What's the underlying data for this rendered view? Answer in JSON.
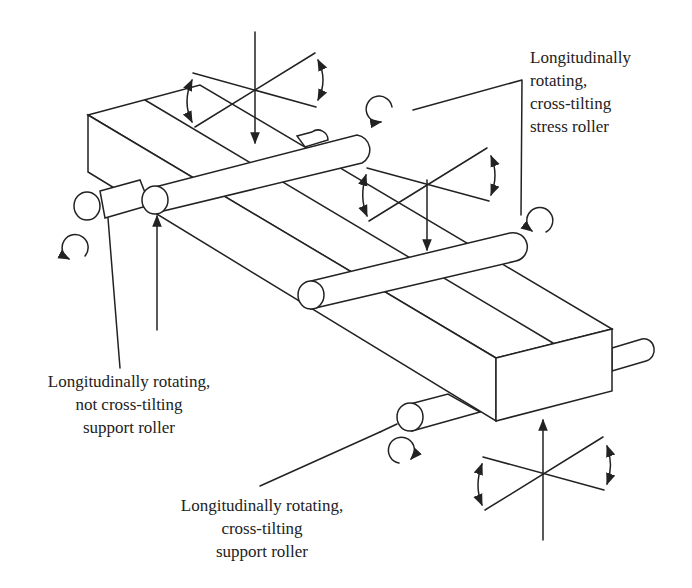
{
  "figure": {
    "type": "technical-diagram",
    "line_color": "#222222",
    "background": "#ffffff"
  },
  "labels": {
    "stress_roller": {
      "lines": [
        "Longitudinally",
        "rotating,",
        "cross-tilting",
        "stress roller"
      ]
    },
    "support_roller_not_tilting": {
      "lines": [
        "Longitudinally rotating,",
        "not cross-tilting",
        "support roller"
      ]
    },
    "support_roller_tilting": {
      "lines": [
        "Longitudinally rotating,",
        "cross-tilting",
        "support roller"
      ]
    }
  },
  "components": {
    "specimen": "rectangular-bar",
    "rollers": [
      {
        "id": "support-left",
        "role": "support",
        "cross_tilting": false
      },
      {
        "id": "stress-left",
        "role": "stress",
        "cross_tilting": true
      },
      {
        "id": "stress-right",
        "role": "stress",
        "cross_tilting": true
      },
      {
        "id": "support-right",
        "role": "support",
        "cross_tilting": true
      }
    ],
    "icons": [
      "rotation-arrow-icon",
      "tilt-axis-icon",
      "force-arrow-icon"
    ]
  }
}
